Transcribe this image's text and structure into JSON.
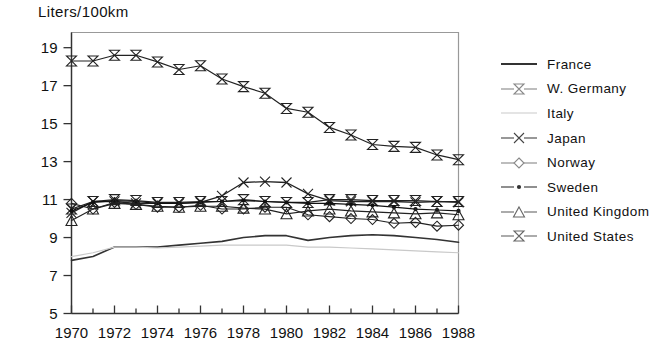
{
  "chart_data": {
    "type": "line",
    "title": "Liters/100km",
    "xlabel": "",
    "ylabel": "Liters/100km",
    "xlim": [
      1970,
      1988
    ],
    "ylim": [
      5,
      19.8
    ],
    "yticks": [
      5,
      7,
      9,
      11,
      13,
      15,
      17,
      19
    ],
    "ytick_labels": [
      "5",
      "7",
      "9",
      "11",
      "13",
      "15",
      "17",
      "19"
    ],
    "xticks": [
      1970,
      1971,
      1972,
      1973,
      1974,
      1975,
      1976,
      1977,
      1978,
      1979,
      1980,
      1981,
      1982,
      1983,
      1984,
      1985,
      1986,
      1987,
      1988
    ],
    "xtick_labels": [
      "1970",
      "1972",
      "1974",
      "1976",
      "1978",
      "1980",
      "1982",
      "1984",
      "1986",
      "1988"
    ],
    "xtick_labeled_values": [
      1970,
      1972,
      1974,
      1976,
      1978,
      1980,
      1982,
      1984,
      1986,
      1988
    ],
    "grid": false,
    "legend_position": "right",
    "x": [
      1970,
      1971,
      1972,
      1973,
      1974,
      1975,
      1976,
      1977,
      1978,
      1979,
      1980,
      1981,
      1982,
      1983,
      1984,
      1985,
      1986,
      1987,
      1988
    ],
    "series": [
      {
        "name": "France",
        "marker": "none",
        "color": "#333333",
        "line_width": 1.6,
        "values": [
          7.8,
          8.0,
          8.5,
          8.5,
          8.5,
          8.6,
          8.7,
          8.8,
          9.0,
          9.1,
          9.1,
          8.85,
          9.0,
          9.1,
          9.15,
          9.1,
          9.0,
          8.9,
          8.75
        ]
      },
      {
        "name": "W. Germany",
        "marker": "bowtie",
        "color": "#222222",
        "line_width": 1.2,
        "values": [
          10.5,
          10.9,
          11.0,
          10.95,
          10.85,
          10.85,
          10.9,
          10.9,
          11.0,
          10.9,
          10.85,
          10.85,
          11.0,
          11.0,
          10.95,
          10.95,
          10.95,
          10.9,
          10.9
        ]
      },
      {
        "name": "Italy",
        "marker": "none",
        "color": "#c9c9c9",
        "line_width": 1.2,
        "values": [
          8.0,
          8.2,
          8.5,
          8.5,
          8.45,
          8.5,
          8.55,
          8.6,
          8.6,
          8.6,
          8.6,
          8.5,
          8.5,
          8.45,
          8.4,
          8.35,
          8.3,
          8.25,
          8.2
        ]
      },
      {
        "name": "Japan",
        "marker": "cross",
        "color": "#222222",
        "line_width": 1.3,
        "values": [
          10.3,
          10.9,
          10.9,
          10.8,
          10.8,
          10.8,
          10.85,
          11.2,
          11.9,
          11.95,
          11.9,
          11.3,
          10.95,
          10.9,
          10.9,
          10.9,
          10.85,
          10.9,
          10.85
        ]
      },
      {
        "name": "Norway",
        "marker": "diamond",
        "color": "#222222",
        "line_width": 1.1,
        "values": [
          10.8,
          10.5,
          10.85,
          10.75,
          10.6,
          10.6,
          10.7,
          10.5,
          10.5,
          10.6,
          10.6,
          10.2,
          10.1,
          10.0,
          9.95,
          9.75,
          9.8,
          9.6,
          9.65
        ]
      },
      {
        "name": "Sweden",
        "marker": "dot",
        "color": "#111111",
        "line_width": 1.2,
        "values": [
          10.4,
          10.85,
          10.95,
          10.9,
          10.8,
          10.8,
          10.85,
          10.9,
          10.95,
          10.9,
          10.85,
          10.8,
          10.8,
          10.75,
          10.7,
          10.6,
          10.5,
          10.45,
          10.4
        ]
      },
      {
        "name": "United Kingdom",
        "marker": "triangle",
        "color": "#222222",
        "line_width": 1.2,
        "values": [
          9.9,
          10.5,
          10.8,
          10.75,
          10.65,
          10.6,
          10.65,
          10.65,
          10.55,
          10.5,
          10.25,
          10.4,
          10.5,
          10.4,
          10.35,
          10.3,
          10.25,
          10.3,
          10.2
        ]
      },
      {
        "name": "United States",
        "marker": "bowtie",
        "color": "#222222",
        "line_width": 1.2,
        "values": [
          18.3,
          18.3,
          18.6,
          18.6,
          18.25,
          17.85,
          18.05,
          17.35,
          16.95,
          16.6,
          15.8,
          15.6,
          14.8,
          14.4,
          13.9,
          13.8,
          13.75,
          13.35,
          13.1
        ]
      }
    ]
  },
  "legend": {
    "items": [
      {
        "label": "France",
        "marker": "none",
        "color": "#333333"
      },
      {
        "label": "W. Germany",
        "marker": "bowtie",
        "color": "#888888"
      },
      {
        "label": "Italy",
        "marker": "none",
        "color": "#c9c9c9"
      },
      {
        "label": "Japan",
        "marker": "cross",
        "color": "#444444"
      },
      {
        "label": "Norway",
        "marker": "diamond",
        "color": "#888888"
      },
      {
        "label": "Sweden",
        "marker": "dot",
        "color": "#333333"
      },
      {
        "label": "United Kingdom",
        "marker": "triangle",
        "color": "#666666"
      },
      {
        "label": "United States",
        "marker": "bowtie",
        "color": "#666666"
      }
    ]
  },
  "axes": {
    "frame_color": "#999999",
    "axis_color": "#333333"
  }
}
